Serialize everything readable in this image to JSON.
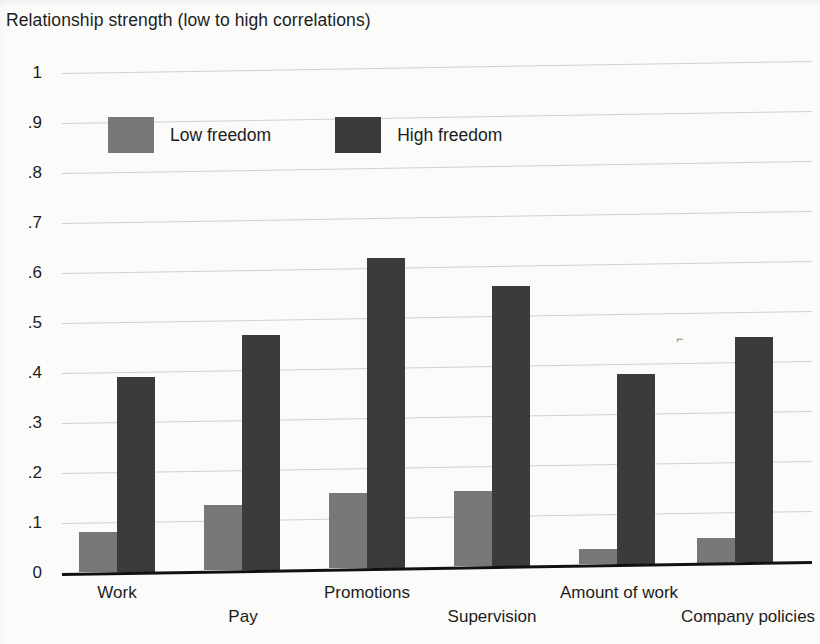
{
  "chart_data": {
    "type": "bar",
    "title": "Relationship strength (low to high correlations)",
    "xlabel": "",
    "ylabel": "Relationship strength (low to high correlations)",
    "ylim": [
      0,
      1
    ],
    "ytick_labels": [
      "1",
      ".9",
      ".8",
      ".7",
      ".6",
      ".5",
      ".4",
      ".3",
      ".2",
      ".1",
      "0"
    ],
    "ytick_values": [
      1,
      0.9,
      0.8,
      0.7,
      0.6,
      0.5,
      0.4,
      0.3,
      0.2,
      0.1,
      0
    ],
    "grid": true,
    "legend_position": "top-left-inside",
    "categories": [
      "Work",
      "Pay",
      "Promotions",
      "Supervision",
      "Amount of work",
      "Company policies"
    ],
    "series": [
      {
        "name": "Low freedom",
        "color": "#787878",
        "values": [
          0.08,
          0.13,
          0.15,
          0.15,
          0.03,
          0.05
        ]
      },
      {
        "name": "High freedom",
        "color": "#3b3b3b",
        "values": [
          0.39,
          0.47,
          0.62,
          0.56,
          0.38,
          0.45
        ]
      }
    ]
  },
  "axis": {
    "title": "Relationship strength (low to high correlations)",
    "yticks": [
      "1",
      ".9",
      ".8",
      ".7",
      ".6",
      ".5",
      ".4",
      ".3",
      ".2",
      ".1",
      "0"
    ]
  },
  "legend": {
    "low_label": "Low freedom",
    "high_label": "High freedom",
    "low_color": "#787878",
    "high_color": "#3b3b3b"
  },
  "xlabels": [
    "Work",
    "Pay",
    "Promotions",
    "Supervision",
    "Amount of work",
    "Company policies"
  ],
  "scan_mark": "⌐"
}
